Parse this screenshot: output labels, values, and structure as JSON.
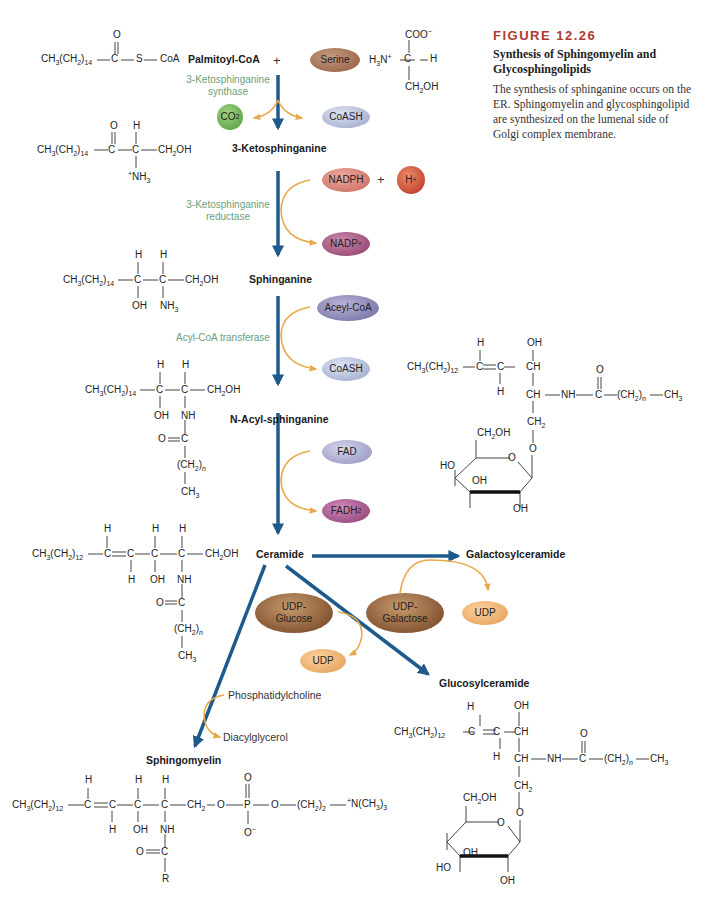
{
  "caption": {
    "figure_number": "FIGURE 12.26",
    "title": "Synthesis of Sphingomyelin and Glycosphingolipids",
    "description": "The synthesis of sphinganine occurs on the ER. Sphingomyelin and glycosphingolipid are synthesized on the lumenal side of Golgi complex membrane."
  },
  "compounds": {
    "palmitoyl_coa": "Palmitoyl-CoA",
    "plus1": "+",
    "ketosphinganine": "3-Ketosphinganine",
    "sphinganine": "Sphinganine",
    "n_acyl_sphinganine": "N-Acyl-sphinganine",
    "ceramide": "Ceramide",
    "galactosylceramide": "Galactosylceramide",
    "glucosylceramide": "Glucosylceramide",
    "sphingomyelin": "Sphingomyelin",
    "phosphatidylcholine": "Phosphatidylcholine",
    "diacylglycerol": "Diacylglycerol"
  },
  "enzymes": {
    "synthase_line1": "3-Ketosphinganine",
    "synthase_line2": "synthase",
    "reductase_line1": "3-Ketosphinganine",
    "reductase_line2": "reductase",
    "transferase": "Acyl-CoA transferase"
  },
  "cofactors": {
    "serine": "Serine",
    "co2": "CO2",
    "coash1": "CoASH",
    "nadph": "NADPH",
    "plus2": "+",
    "h_plus": "H+",
    "nadp": "NADP+",
    "acyl_coa": "Aceyl-CoA",
    "coash2": "CoASH",
    "fad": "FAD",
    "fadh2": "FADH2",
    "udp_glucose_1": "UDP-",
    "udp_glucose_2": "Glucose",
    "udp_galactose_1": "UDP-",
    "udp_galactose_2": "Galactose",
    "udp1": "UDP",
    "udp2": "UDP"
  },
  "formulas": {
    "palmitoyl_chain": "CH3(CH2)14",
    "ketosphinganine_chain": "CH3(CH2)14",
    "sphinganine_chain": "CH3(CH2)14",
    "nacyl_chain": "CH3(CH2)14",
    "ceramide_chain": "CH3(CH2)12",
    "sphingomyelin_chain": "CH3(CH2)12",
    "galcer_chain": "CH3(CH2)12",
    "glccer_chain": "CH3(CH2)12"
  },
  "colors": {
    "main_arrow": "#1f5a8c",
    "side_arrow": "#e8a94a",
    "enzyme_text": "#6a9e7c",
    "figure_number": "#b03a2e"
  }
}
